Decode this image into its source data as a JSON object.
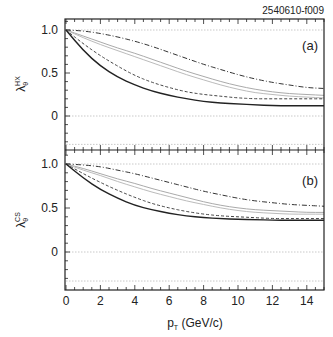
{
  "figure_id": "2540610-f009",
  "chart_data": [
    {
      "type": "line",
      "panel_label": "(a)",
      "ylabel": "λθ^HX",
      "ylabel_main": "λ",
      "ylabel_sub": "θ",
      "ylabel_sup": "HX",
      "xlabel": "pT (GeV/c)",
      "xlim": [
        0,
        15
      ],
      "ylim": [
        -0.4,
        1.1
      ],
      "yticks": [
        0,
        0.5,
        1.0
      ],
      "ytick_labels": [
        "0",
        "0.5",
        "1.0"
      ],
      "reference_lines": [
        1.0,
        0,
        -0.33
      ],
      "x": [
        0,
        1,
        2,
        3,
        4,
        5,
        6,
        7,
        8,
        9,
        10,
        11,
        12,
        13,
        14,
        15
      ],
      "series": [
        {
          "name": "dash-dot",
          "style": "dashdot",
          "color": "#333333",
          "values": [
            1.0,
            0.99,
            0.96,
            0.92,
            0.87,
            0.81,
            0.74,
            0.67,
            0.6,
            0.54,
            0.48,
            0.43,
            0.39,
            0.36,
            0.33,
            0.32
          ]
        },
        {
          "name": "grey-1",
          "style": "solid",
          "color": "#aaaaaa",
          "values": [
            1.0,
            0.93,
            0.86,
            0.79,
            0.73,
            0.66,
            0.59,
            0.52,
            0.46,
            0.4,
            0.35,
            0.31,
            0.28,
            0.26,
            0.25,
            0.24
          ]
        },
        {
          "name": "grey-2",
          "style": "solid",
          "color": "#bbbbbb",
          "values": [
            1.0,
            0.91,
            0.83,
            0.76,
            0.69,
            0.62,
            0.55,
            0.48,
            0.42,
            0.36,
            0.31,
            0.27,
            0.25,
            0.23,
            0.22,
            0.21
          ]
        },
        {
          "name": "dashed",
          "style": "dashed",
          "color": "#444444",
          "values": [
            1.0,
            0.84,
            0.7,
            0.58,
            0.47,
            0.39,
            0.33,
            0.28,
            0.25,
            0.23,
            0.21,
            0.2,
            0.2,
            0.2,
            0.2,
            0.2
          ]
        },
        {
          "name": "solid",
          "style": "solid",
          "color": "#222222",
          "values": [
            1.0,
            0.76,
            0.58,
            0.45,
            0.36,
            0.29,
            0.24,
            0.2,
            0.17,
            0.15,
            0.14,
            0.13,
            0.12,
            0.12,
            0.12,
            0.12
          ]
        }
      ]
    },
    {
      "type": "line",
      "panel_label": "(b)",
      "ylabel": "λθ^CS",
      "ylabel_main": "λ",
      "ylabel_sub": "θ",
      "ylabel_sup": "CS",
      "xlabel": "pT (GeV/c)",
      "xlim": [
        0,
        15
      ],
      "ylim": [
        -0.4,
        1.1
      ],
      "yticks": [
        0,
        0.5,
        1.0
      ],
      "ytick_labels": [
        "0",
        "0.5",
        "1.0"
      ],
      "xticks": [
        0,
        2,
        4,
        6,
        8,
        10,
        12,
        14
      ],
      "xtick_labels": [
        "0",
        "2",
        "4",
        "6",
        "8",
        "10",
        "12",
        "14"
      ],
      "reference_lines": [
        1.0,
        0,
        -0.33
      ],
      "x": [
        0,
        1,
        2,
        3,
        4,
        5,
        6,
        7,
        8,
        9,
        10,
        11,
        12,
        13,
        14,
        15
      ],
      "series": [
        {
          "name": "dash-dot",
          "style": "dashdot",
          "color": "#333333",
          "values": [
            1.0,
            0.99,
            0.97,
            0.93,
            0.89,
            0.84,
            0.79,
            0.74,
            0.69,
            0.65,
            0.61,
            0.58,
            0.56,
            0.54,
            0.53,
            0.52
          ]
        },
        {
          "name": "grey-1",
          "style": "solid",
          "color": "#aaaaaa",
          "values": [
            1.0,
            0.95,
            0.89,
            0.83,
            0.78,
            0.72,
            0.67,
            0.62,
            0.57,
            0.53,
            0.5,
            0.48,
            0.47,
            0.46,
            0.45,
            0.45
          ]
        },
        {
          "name": "grey-2",
          "style": "solid",
          "color": "#bbbbbb",
          "values": [
            1.0,
            0.93,
            0.87,
            0.8,
            0.74,
            0.68,
            0.63,
            0.58,
            0.54,
            0.5,
            0.47,
            0.45,
            0.44,
            0.43,
            0.43,
            0.43
          ]
        },
        {
          "name": "dashed",
          "style": "dashed",
          "color": "#444444",
          "values": [
            1.0,
            0.89,
            0.79,
            0.7,
            0.62,
            0.55,
            0.5,
            0.46,
            0.43,
            0.41,
            0.4,
            0.39,
            0.38,
            0.38,
            0.38,
            0.38
          ]
        },
        {
          "name": "solid",
          "style": "solid",
          "color": "#222222",
          "values": [
            1.0,
            0.84,
            0.71,
            0.61,
            0.53,
            0.48,
            0.44,
            0.41,
            0.39,
            0.38,
            0.37,
            0.37,
            0.36,
            0.36,
            0.36,
            0.36
          ]
        }
      ]
    }
  ],
  "xaxis": {
    "label_main": "p",
    "label_sub": "T",
    "label_rest": " (GeV/c)"
  }
}
